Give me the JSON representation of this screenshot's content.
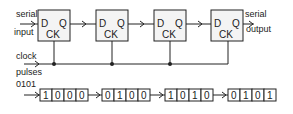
{
  "diagram": {
    "labels": {
      "serial_input_1": "serial",
      "serial_input_2": "input",
      "serial_output_1": "serial",
      "serial_output_2": "output",
      "clock_1": "clock",
      "clock_2": "pulses",
      "input_word": "0101"
    },
    "flip_flops": [
      {
        "d": "D",
        "q": "Q",
        "ck": "CK"
      },
      {
        "d": "D",
        "q": "Q",
        "ck": "CK"
      },
      {
        "d": "D",
        "q": "Q",
        "ck": "CK"
      },
      {
        "d": "D",
        "q": "Q",
        "ck": "CK"
      }
    ],
    "register_states": [
      [
        "1",
        "0",
        "0",
        "0"
      ],
      [
        "0",
        "1",
        "0",
        "0"
      ],
      [
        "1",
        "0",
        "1",
        "0"
      ],
      [
        "0",
        "1",
        "0",
        "1"
      ]
    ]
  }
}
